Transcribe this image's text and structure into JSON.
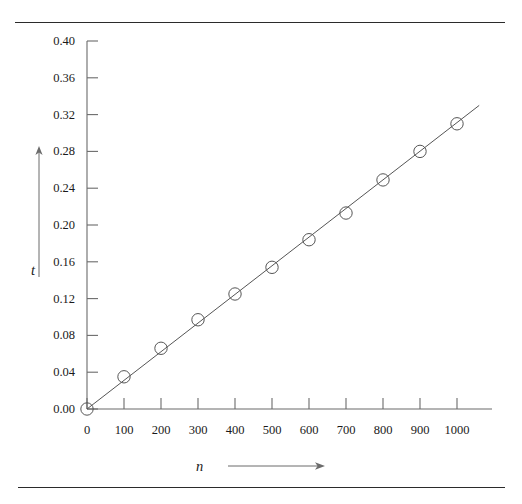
{
  "figure": {
    "background_color": "#ffffff",
    "line_color": "#555555",
    "axis_color": "#6b6b6b",
    "text_color": "#1a1a1a",
    "rule_color": "#2b2b2b",
    "top_rule": "horizontal-rule",
    "bottom_rule": "horizontal-rule"
  },
  "chart_data": {
    "type": "scatter",
    "title": "",
    "xlabel": "n",
    "ylabel": "t",
    "xlim": [
      0,
      1000
    ],
    "ylim": [
      0.0,
      0.4
    ],
    "grid": false,
    "legend": "none",
    "x_tick_labels": [
      "0",
      "100",
      "200",
      "300",
      "400",
      "500",
      "600",
      "700",
      "800",
      "900",
      "1000"
    ],
    "x_ticks": [
      0,
      100,
      200,
      300,
      400,
      500,
      600,
      700,
      800,
      900,
      1000
    ],
    "y_tick_labels": [
      "0.00",
      "0.04",
      "0.08",
      "0.12",
      "0.16",
      "0.20",
      "0.24",
      "0.28",
      "0.32",
      "0.36",
      "0.40"
    ],
    "y_ticks": [
      0.0,
      0.04,
      0.08,
      0.12,
      0.16,
      0.2,
      0.24,
      0.28,
      0.32,
      0.36,
      0.4
    ],
    "x": [
      0,
      100,
      200,
      300,
      400,
      500,
      600,
      700,
      800,
      900,
      1000
    ],
    "values": [
      0.0,
      0.035,
      0.066,
      0.097,
      0.125,
      0.154,
      0.184,
      0.213,
      0.249,
      0.28,
      0.31
    ],
    "marker": "open-circle",
    "fit_line": {
      "type": "line",
      "x": [
        0,
        1060
      ],
      "y": [
        0.0,
        0.33
      ]
    },
    "axis_arrows": {
      "y_axis_arrow": "up-arrow",
      "x_axis_arrow": "right-arrow"
    }
  }
}
